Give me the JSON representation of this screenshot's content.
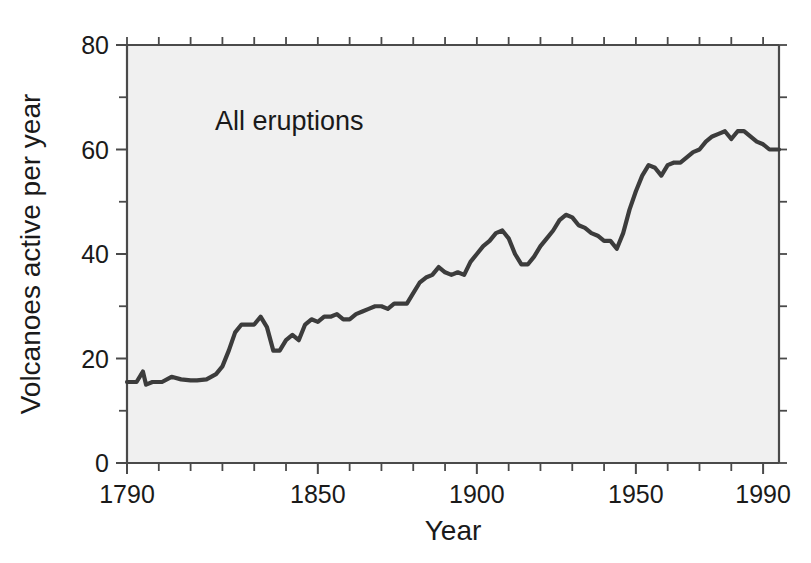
{
  "chart_data": {
    "type": "line",
    "title": "",
    "xlabel": "Year",
    "ylabel": "Volcanoes active per year",
    "annotation": "All eruptions",
    "xlim": [
      1790,
      1995
    ],
    "ylim": [
      0,
      80
    ],
    "grid": false,
    "legend": null,
    "line_color": "#3c3c3c",
    "plot_background": "#f0f0f0",
    "page_background": "#ffffff",
    "axis_color": "#4a4a4a",
    "xticks_major": [
      1790,
      1850,
      1900,
      1950,
      1990
    ],
    "xtick_labels": [
      "1790",
      "1850",
      "1900",
      "1950",
      "1990"
    ],
    "xticks_minor": [
      1800,
      1810,
      1820,
      1830,
      1840,
      1860,
      1870,
      1880,
      1890,
      1910,
      1920,
      1930,
      1940,
      1960,
      1970,
      1980
    ],
    "yticks_major": [
      0,
      20,
      40,
      60,
      80
    ],
    "ytick_labels": [
      "0",
      "20",
      "40",
      "60",
      "80"
    ],
    "yticks_minor": [
      10,
      30,
      50,
      70
    ],
    "series": [
      {
        "name": "All eruptions",
        "x": [
          1790,
          1793,
          1795,
          1796,
          1798,
          1801,
          1804,
          1807,
          1810,
          1812,
          1815,
          1818,
          1820,
          1822,
          1824,
          1826,
          1828,
          1830,
          1832,
          1834,
          1836,
          1838,
          1840,
          1842,
          1844,
          1846,
          1848,
          1850,
          1852,
          1854,
          1856,
          1858,
          1860,
          1862,
          1864,
          1866,
          1868,
          1870,
          1872,
          1874,
          1876,
          1878,
          1880,
          1882,
          1884,
          1886,
          1888,
          1890,
          1892,
          1894,
          1896,
          1898,
          1900,
          1902,
          1904,
          1906,
          1908,
          1910,
          1912,
          1914,
          1916,
          1918,
          1920,
          1922,
          1924,
          1926,
          1928,
          1930,
          1932,
          1934,
          1936,
          1938,
          1940,
          1942,
          1944,
          1946,
          1948,
          1950,
          1952,
          1954,
          1956,
          1958,
          1960,
          1962,
          1964,
          1966,
          1968,
          1970,
          1972,
          1974,
          1976,
          1978,
          1980,
          1982,
          1984,
          1986,
          1988,
          1990,
          1992,
          1995
        ],
        "y": [
          15.5,
          15.5,
          17.5,
          15.0,
          15.5,
          15.5,
          16.5,
          16.0,
          15.8,
          15.8,
          16.0,
          17.0,
          18.5,
          21.5,
          25.0,
          26.5,
          26.5,
          26.5,
          28.0,
          26.0,
          21.5,
          21.5,
          23.5,
          24.5,
          23.5,
          26.5,
          27.5,
          27.0,
          28.0,
          28.0,
          28.5,
          27.5,
          27.5,
          28.5,
          29.0,
          29.5,
          30.0,
          30.0,
          29.5,
          30.5,
          30.5,
          30.5,
          32.5,
          34.5,
          35.5,
          36.0,
          37.5,
          36.5,
          36.0,
          36.5,
          36.0,
          38.5,
          40.0,
          41.5,
          42.5,
          44.0,
          44.5,
          43.0,
          40.0,
          38.0,
          38.0,
          39.5,
          41.5,
          43.0,
          44.5,
          46.5,
          47.5,
          47.0,
          45.5,
          45.0,
          44.0,
          43.5,
          42.5,
          42.5,
          41.0,
          44.0,
          48.5,
          52.0,
          55.0,
          57.0,
          56.5,
          55.0,
          57.0,
          57.5,
          57.5,
          58.5,
          59.5,
          60.0,
          61.5,
          62.5,
          63.0,
          63.5,
          62.0,
          63.5,
          63.5,
          62.5,
          61.5,
          61.0,
          60.0,
          60.0
        ]
      }
    ]
  },
  "axis": {
    "y_title": "Volcanoes active per year",
    "x_title": "Year"
  },
  "annotation": {
    "label": "All eruptions"
  }
}
